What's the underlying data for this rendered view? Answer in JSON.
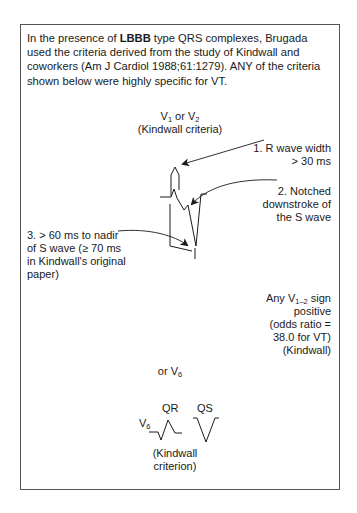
{
  "intro": {
    "prefix": "In the presence of ",
    "bold": "LBBB",
    "suffix": " type QRS complexes, Brugada used the criteria derived from the study of Kindwall and coworkers (Am J Cardiol 1988;61:1279). ANY of the criteria shown below were highly specific for VT."
  },
  "lead_header": {
    "v": "V",
    "sub1": "1",
    "or": " or V",
    "sub2": "2",
    "caption": "(Kindwall criteria)"
  },
  "criteria": [
    {
      "num": "1.",
      "line1": "R wave width",
      "line2": "> 30 ms"
    },
    {
      "num": "2.",
      "line1": "Notched",
      "line2": "downstroke of",
      "line3": "the S wave"
    },
    {
      "num": "3.",
      "line1": "> 60 ms to nadir",
      "line2": "of S wave (≥ 70 ms",
      "line3": "in Kindwall's original",
      "line4": "paper)"
    }
  ],
  "summary": {
    "pre": "Any V",
    "sub": "1–2",
    "post": " sign",
    "line2": "positive",
    "line3": "(odds ratio =",
    "line4": "38.0 for VT)",
    "line5": "(Kindwall)"
  },
  "v6_section": {
    "or_text": "or V",
    "or_sub": "6",
    "lead_label": "V",
    "lead_sub": "6",
    "qr_label": "QR",
    "qs_label": "QS",
    "caption_line1": "(Kindwall",
    "caption_line2": "criterion)"
  },
  "colors": {
    "ink": "#1a1a1a",
    "frame": "#555555",
    "background": "#ffffff"
  }
}
